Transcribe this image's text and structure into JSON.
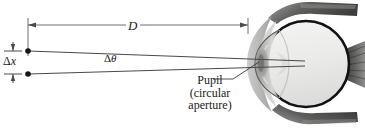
{
  "figure": {
    "labels": {
      "distance": "D",
      "separation_delta": "Δ",
      "separation_var": "x",
      "angle_delta": "Δ",
      "angle_var": "θ",
      "pupil_line1": "Pupil",
      "pupil_line2": "(circular",
      "pupil_line3": "aperture)"
    },
    "colors": {
      "ink": "#1a1a1a",
      "ray": "#4a4a4a",
      "dimension_line": "#6e6e6e",
      "sclera_outline": "#111111",
      "vitreous_fill": "#ececeb",
      "cornea_fill": "#b9b9b7",
      "muscle_dark": "#3a3a3a",
      "tissue_gray": "#b4b4b2",
      "background": "#ffffff"
    },
    "geometry": {
      "source_point_upper": [
        28,
        51
      ],
      "source_point_lower": [
        28,
        74
      ],
      "dimension_y": 25,
      "dimension_x_left": 28,
      "dimension_x_right": 248,
      "eye_center": [
        306,
        64
      ],
      "eye_radius": 43,
      "pupil_center": [
        262,
        63
      ]
    }
  }
}
